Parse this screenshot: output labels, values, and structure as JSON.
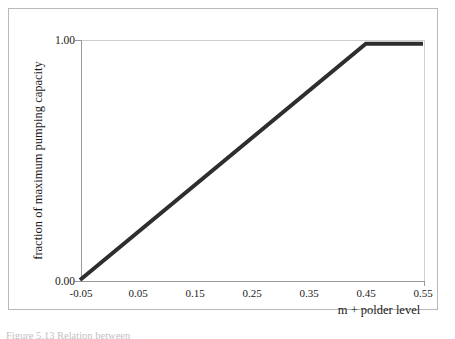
{
  "figure": {
    "caption_fragment": "Figure 5.13 Relation between",
    "frame_color": "#b9b9b9",
    "background": "#ffffff"
  },
  "chart_data": {
    "type": "line",
    "title": "",
    "subtitle": "",
    "xlabel": "m + polder level",
    "ylabel": "fraction of maximum pumping capacity",
    "xlim": [
      -0.05,
      0.55
    ],
    "ylim": [
      0.0,
      1.0
    ],
    "grid": false,
    "legend": null,
    "x_ticks": [
      -0.05,
      0.05,
      0.15,
      0.25,
      0.35,
      0.45,
      0.55
    ],
    "x_tick_labels": [
      "-0.05",
      "0.05",
      "0.15",
      "0.25",
      "0.35",
      "0.45",
      "0.55"
    ],
    "y_ticks": [
      0.0,
      1.0
    ],
    "y_tick_labels": [
      "0.00",
      "1.00"
    ],
    "series": [
      {
        "name": "pumping capacity curve",
        "color": "#2e2e2e",
        "line_width": 4,
        "x": [
          -0.05,
          0.45,
          0.55
        ],
        "y": [
          0.0,
          0.98,
          0.98
        ]
      }
    ],
    "annotations": []
  }
}
